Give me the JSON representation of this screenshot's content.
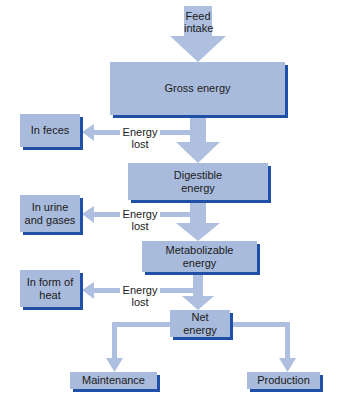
{
  "diagram": {
    "colors": {
      "box_fill": "#a9bbdc",
      "box_shadow": "#1f4fa6",
      "arrow": "#aebfdf"
    },
    "feed_intake": "Feed intake",
    "stages": {
      "gross": "Gross energy",
      "digestible": "Digestible energy",
      "metabolizable": "Metabolizable energy",
      "net": "Net energy"
    },
    "losses": [
      {
        "label": "Energy lost",
        "destination": "In feces"
      },
      {
        "label": "Energy lost",
        "destination": "In urine and gases"
      },
      {
        "label": "Energy lost",
        "destination": "In form of heat"
      }
    ],
    "outputs": {
      "left": "Maintenance",
      "right": "Production"
    }
  }
}
